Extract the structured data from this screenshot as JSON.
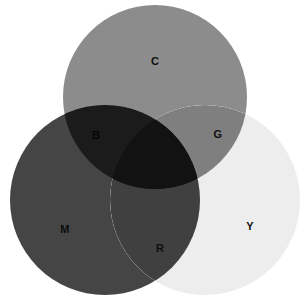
{
  "figure": {
    "name": "cmy-subtractive-venn",
    "background_color": "#ffffff",
    "width": 308,
    "height": 304
  },
  "chart_data": {
    "type": "venn",
    "title": "",
    "subtitle": "",
    "xlabel": "",
    "ylabel": "",
    "grid": false,
    "legend_position": "none",
    "blend_mode": "multiply",
    "sets": [
      {
        "id": "C",
        "label": "C",
        "name": "cyan",
        "cx": 155,
        "cy": 97,
        "r": 92,
        "color": "#8c8c8c",
        "label_x": 155,
        "label_y": 61,
        "label_color": "#101010"
      },
      {
        "id": "M",
        "label": "M",
        "name": "magenta",
        "cx": 105,
        "cy": 200,
        "r": 95,
        "color": "#454545",
        "label_x": 65,
        "label_y": 229,
        "label_color": "#0d0d0d"
      },
      {
        "id": "Y",
        "label": "Y",
        "name": "yellow",
        "cx": 205,
        "cy": 200,
        "r": 95,
        "color": "#ededed",
        "label_x": 250,
        "label_y": 226,
        "label_color": "#101010"
      }
    ],
    "intersections": [
      {
        "id": "B",
        "label": "B",
        "name": "blue",
        "sets": [
          "C",
          "M"
        ],
        "color": "#1b1b1b",
        "label_x": 96,
        "label_y": 135,
        "label_color": "#050505"
      },
      {
        "id": "G",
        "label": "G",
        "name": "green",
        "sets": [
          "C",
          "Y"
        ],
        "color": "#7f7f7f",
        "label_x": 218,
        "label_y": 134,
        "label_color": "#101010"
      },
      {
        "id": "R",
        "label": "R",
        "name": "red",
        "sets": [
          "M",
          "Y"
        ],
        "color": "#404040",
        "label_x": 160,
        "label_y": 248,
        "label_color": "#0d0d0d"
      },
      {
        "id": "K",
        "label": "",
        "name": "black-center",
        "sets": [
          "C",
          "M",
          "Y"
        ],
        "color": "#121212",
        "label_x": 155,
        "label_y": 175,
        "label_color": "#000000"
      }
    ],
    "labels": [
      "C",
      "M",
      "Y",
      "B",
      "G",
      "R"
    ]
  }
}
